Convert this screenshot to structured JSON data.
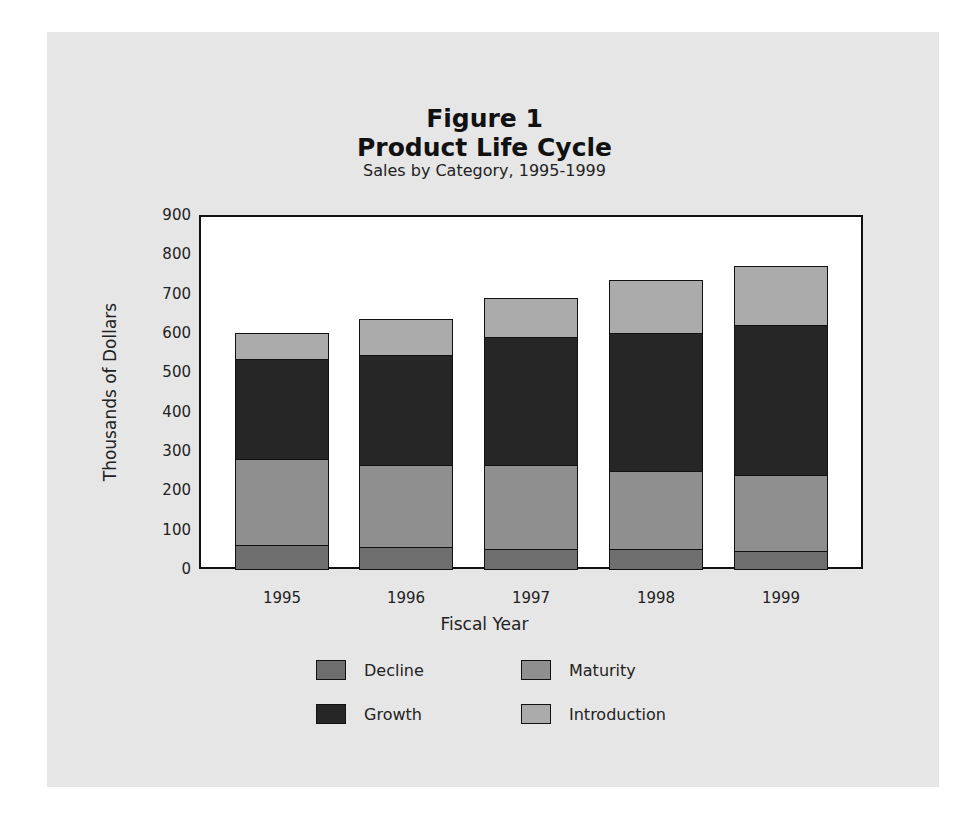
{
  "figure": {
    "label": "Figure 1",
    "title": "Product Life Cycle",
    "subtitle": "Sales by Category, 1995-1999"
  },
  "axes": {
    "ylabel": "Thousands of Dollars",
    "xlabel": "Fiscal Year",
    "yticks": [
      "900",
      "800",
      "700",
      "600",
      "500",
      "400",
      "300",
      "200",
      "100",
      "0"
    ],
    "xticks": [
      "1995",
      "1996",
      "1997",
      "1998",
      "1999"
    ]
  },
  "legend": {
    "items": [
      {
        "label": "Decline",
        "color": "#6e6e6e"
      },
      {
        "label": "Maturity",
        "color": "#8f8f8f"
      },
      {
        "label": "Growth",
        "color": "#262626"
      },
      {
        "label": "Introduction",
        "color": "#ababab"
      }
    ]
  },
  "colors": {
    "panel_background": "#e6e6e6",
    "plot_background": "#ffffff",
    "decline": "#6e6e6e",
    "maturity": "#8f8f8f",
    "growth": "#262626",
    "introduction": "#ababab"
  },
  "chart_data": {
    "type": "bar",
    "stacked": true,
    "subtitle": "Sales by Category, 1995-1999",
    "xlabel": "Fiscal Year",
    "ylabel": "Thousands of Dollars",
    "ylim": [
      0,
      900
    ],
    "yticks": [
      0,
      100,
      200,
      300,
      400,
      500,
      600,
      700,
      800,
      900
    ],
    "grid": false,
    "legend_position": "bottom",
    "categories": [
      "1995",
      "1996",
      "1997",
      "1998",
      "1999"
    ],
    "series": [
      {
        "name": "Decline",
        "color": "#6e6e6e",
        "values": [
          60,
          55,
          50,
          50,
          45
        ]
      },
      {
        "name": "Maturity",
        "color": "#8f8f8f",
        "values": [
          220,
          210,
          215,
          200,
          195
        ]
      },
      {
        "name": "Growth",
        "color": "#262626",
        "values": [
          255,
          280,
          325,
          350,
          380
        ]
      },
      {
        "name": "Introduction",
        "color": "#ababab",
        "values": [
          65,
          90,
          100,
          135,
          150
        ]
      }
    ],
    "totals": [
      600,
      635,
      690,
      735,
      770
    ]
  }
}
